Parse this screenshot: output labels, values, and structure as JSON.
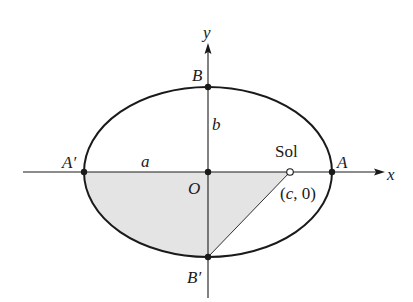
{
  "diagram": {
    "labels": {
      "y_axis": "y",
      "x_axis": "x",
      "vertex_top": "B",
      "vertex_bottom": "B′",
      "vertex_right": "A",
      "vertex_left": "A′",
      "origin": "O",
      "semi_minor": "b",
      "semi_major": "a",
      "sun": "Sol",
      "focus": "(c, 0)"
    },
    "colors": {
      "stroke": "#1a1a1a",
      "shade": "#e4e4e4",
      "background": "#ffffff"
    },
    "geometry_units": {
      "a": 1.0,
      "b": 0.685,
      "c": 0.66
    }
  }
}
